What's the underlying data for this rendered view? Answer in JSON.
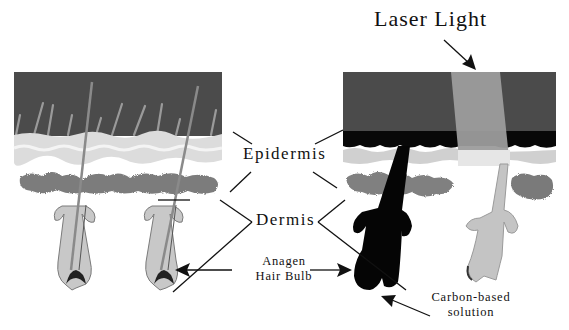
{
  "labels": {
    "laser_light": "Laser Light",
    "epidermis": "Epidermis",
    "dermis": "Dermis",
    "anagen_line1": "Anagen",
    "anagen_line2": "Hair Bulb",
    "carbon_line1": "Carbon-based",
    "carbon_line2": "solution"
  },
  "panels": {
    "left": {
      "description": "untreated skin with hair follicles"
    },
    "right": {
      "description": "carbon-treated skin under laser light"
    }
  },
  "colors": {
    "surface_dark": "#4a4a4a",
    "carbon_black": "#0a0a0a",
    "epidermis_light": "#d8d8d8",
    "dermis_grey": "#7a7a7a",
    "laser_beam": "#9a9a9a",
    "hair": "#8a8a8a",
    "line": "#111111"
  }
}
